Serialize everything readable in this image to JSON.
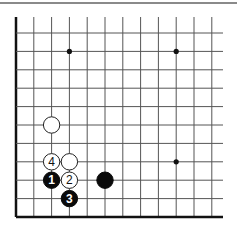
{
  "diagram": {
    "type": "go-board-fragment",
    "colors": {
      "black": "#0a0a0a",
      "white": "#ffffff",
      "grid": "#555555",
      "edge": "#111111",
      "rule": "#8a8a8a"
    },
    "grid": {
      "columns": 12,
      "rows": 11,
      "x0": 16,
      "dx": 17.8,
      "y0": 33,
      "dy": 18.4,
      "open_top_y": 17,
      "open_right_x": 223,
      "edges": [
        "left",
        "bottom"
      ]
    },
    "star_points": [
      {
        "col": 3,
        "row": 1
      },
      {
        "col": 9,
        "row": 1
      },
      {
        "col": 9,
        "row": 7
      }
    ],
    "stones": [
      {
        "color": "white",
        "col": 2,
        "row": 5,
        "label": ""
      },
      {
        "color": "white",
        "col": 2,
        "row": 7,
        "label": "4"
      },
      {
        "color": "white",
        "col": 3,
        "row": 7,
        "label": ""
      },
      {
        "color": "black",
        "col": 2,
        "row": 8,
        "label": "1"
      },
      {
        "color": "white",
        "col": 3,
        "row": 8,
        "label": "2"
      },
      {
        "color": "black",
        "col": 3,
        "row": 9,
        "label": "3"
      },
      {
        "color": "black",
        "col": 5,
        "row": 8,
        "label": ""
      }
    ]
  }
}
